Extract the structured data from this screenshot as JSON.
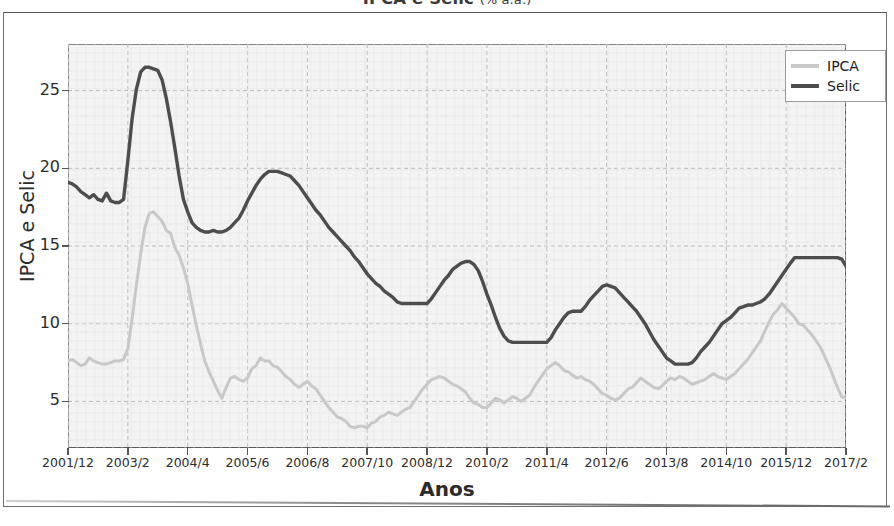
{
  "figure": {
    "title_main": "IPCA e Selic",
    "title_sub": "(% a.a.)",
    "title_full": "IPCA e Selic (% a.a.)"
  },
  "legend": {
    "position": "top-right",
    "entries": [
      {
        "label": "IPCA",
        "color": "#c8c8c8"
      },
      {
        "label": "Selic",
        "color": "#4d4d4d"
      }
    ]
  },
  "axes": {
    "ylabel": "IPCA e Selic",
    "xlabel": "Anos",
    "yticks": [
      "5",
      "10",
      "15",
      "20",
      "25"
    ],
    "ylim": [
      2.0,
      28.0
    ],
    "grid": "dashed"
  },
  "chart_data": {
    "type": "line",
    "title": "IPCA e Selic (% a.a.)",
    "xlabel": "Anos",
    "ylabel": "IPCA e Selic",
    "ylim": [
      2.0,
      28.0
    ],
    "grid": true,
    "legend_position": "upper right",
    "xtick_labels": [
      "2001/12",
      "2003/2",
      "2004/4",
      "2005/6",
      "2006/8",
      "2007/10",
      "2008/12",
      "2010/2",
      "2011/4",
      "2012/6",
      "2013/8",
      "2014/10",
      "2015/12",
      "2017/2"
    ],
    "xtick_indices": [
      0,
      14,
      28,
      42,
      56,
      70,
      84,
      98,
      112,
      126,
      140,
      154,
      168,
      182
    ],
    "x_start": "2001/12",
    "x_end": "2017/2",
    "n_points": 184,
    "series": [
      {
        "name": "IPCA",
        "color": "#c8c8c8",
        "values": [
          7.6,
          7.7,
          7.5,
          7.3,
          7.4,
          7.8,
          7.6,
          7.5,
          7.4,
          7.4,
          7.5,
          7.6,
          7.6,
          7.7,
          8.4,
          10.3,
          12.5,
          14.5,
          16.2,
          17.1,
          17.2,
          16.9,
          16.6,
          16.0,
          15.8,
          14.9,
          14.4,
          13.6,
          12.6,
          11.2,
          9.9,
          8.7,
          7.6,
          6.9,
          6.3,
          5.7,
          5.2,
          5.9,
          6.5,
          6.6,
          6.4,
          6.3,
          6.5,
          7.1,
          7.3,
          7.8,
          7.6,
          7.6,
          7.3,
          7.2,
          6.9,
          6.6,
          6.4,
          6.1,
          5.9,
          6.1,
          6.3,
          6.0,
          5.8,
          5.4,
          5.0,
          4.6,
          4.3,
          4.0,
          3.9,
          3.7,
          3.4,
          3.3,
          3.4,
          3.4,
          3.3,
          3.6,
          3.7,
          4.0,
          4.1,
          4.3,
          4.2,
          4.1,
          4.3,
          4.5,
          4.6,
          5.0,
          5.4,
          5.8,
          6.1,
          6.4,
          6.5,
          6.6,
          6.5,
          6.3,
          6.1,
          6.0,
          5.8,
          5.6,
          5.2,
          4.9,
          4.8,
          4.6,
          4.6,
          4.9,
          5.2,
          5.1,
          4.9,
          5.1,
          5.3,
          5.2,
          5.0,
          5.2,
          5.4,
          5.9,
          6.3,
          6.7,
          7.1,
          7.3,
          7.5,
          7.3,
          7.0,
          6.9,
          6.7,
          6.5,
          6.6,
          6.4,
          6.3,
          6.1,
          5.8,
          5.5,
          5.4,
          5.2,
          5.1,
          5.2,
          5.5,
          5.8,
          5.9,
          6.2,
          6.5,
          6.3,
          6.1,
          5.9,
          5.8,
          6.0,
          6.3,
          6.5,
          6.4,
          6.6,
          6.5,
          6.3,
          6.1,
          6.2,
          6.3,
          6.4,
          6.6,
          6.8,
          6.6,
          6.5,
          6.4,
          6.6,
          6.8,
          7.1,
          7.4,
          7.7,
          8.1,
          8.5,
          8.9,
          9.5,
          10.1,
          10.6,
          10.9,
          11.3,
          11.0,
          10.7,
          10.4,
          10.0,
          9.9,
          9.6,
          9.3,
          8.9,
          8.5,
          7.9,
          7.3,
          6.6,
          5.9,
          5.3,
          5.2
        ]
      },
      {
        "name": "Selic",
        "color": "#4d4d4d",
        "values": [
          19.1,
          19.0,
          18.8,
          18.5,
          18.3,
          18.1,
          18.3,
          18.0,
          17.9,
          18.4,
          17.9,
          17.8,
          17.8,
          18.0,
          20.5,
          23.2,
          25.1,
          26.2,
          26.5,
          26.5,
          26.4,
          26.3,
          25.7,
          24.5,
          23.0,
          21.3,
          19.5,
          18.0,
          17.2,
          16.5,
          16.2,
          16.0,
          15.9,
          15.9,
          16.0,
          15.9,
          15.9,
          16.0,
          16.2,
          16.5,
          16.8,
          17.3,
          17.9,
          18.4,
          18.9,
          19.3,
          19.6,
          19.8,
          19.8,
          19.8,
          19.7,
          19.6,
          19.5,
          19.2,
          18.9,
          18.5,
          18.1,
          17.7,
          17.3,
          17.0,
          16.6,
          16.2,
          15.9,
          15.6,
          15.3,
          15.0,
          14.7,
          14.3,
          14.0,
          13.6,
          13.2,
          12.9,
          12.6,
          12.4,
          12.1,
          11.9,
          11.7,
          11.4,
          11.3,
          11.3,
          11.3,
          11.3,
          11.3,
          11.3,
          11.3,
          11.6,
          12.0,
          12.4,
          12.8,
          13.1,
          13.5,
          13.7,
          13.9,
          14.0,
          14.0,
          13.8,
          13.4,
          12.7,
          11.9,
          11.2,
          10.4,
          9.7,
          9.2,
          8.9,
          8.8,
          8.8,
          8.8,
          8.8,
          8.8,
          8.8,
          8.8,
          8.8,
          8.8,
          9.1,
          9.6,
          10.0,
          10.4,
          10.7,
          10.8,
          10.8,
          10.8,
          11.1,
          11.5,
          11.8,
          12.1,
          12.4,
          12.5,
          12.4,
          12.3,
          12.0,
          11.7,
          11.4,
          11.1,
          10.8,
          10.4,
          10.0,
          9.5,
          9.0,
          8.6,
          8.2,
          7.8,
          7.6,
          7.4,
          7.4,
          7.4,
          7.4,
          7.5,
          7.8,
          8.2,
          8.5,
          8.8,
          9.2,
          9.6,
          10.0,
          10.2,
          10.4,
          10.7,
          11.0,
          11.1,
          11.2,
          11.2,
          11.3,
          11.4,
          11.6,
          11.9,
          12.3,
          12.7,
          13.1,
          13.5,
          13.9,
          14.25,
          14.25,
          14.25,
          14.25,
          14.25,
          14.25,
          14.25,
          14.25,
          14.25,
          14.25,
          14.25,
          14.15,
          13.7,
          13.0,
          12.5
        ]
      }
    ]
  }
}
